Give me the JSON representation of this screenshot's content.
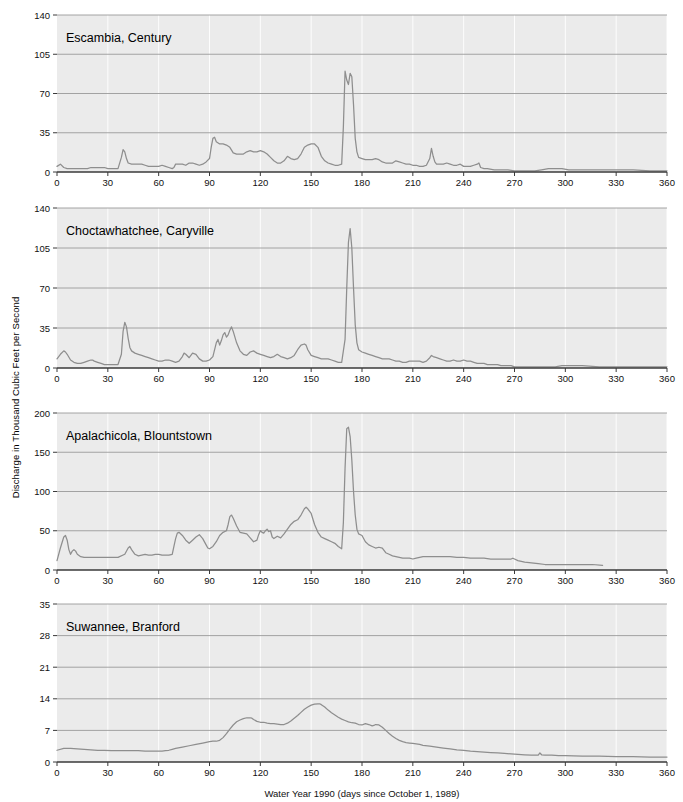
{
  "figure": {
    "width": 683,
    "height": 802,
    "background": "#ffffff",
    "plot_background": "#ebebeb",
    "line_color": "#8e8e8e",
    "hgrid_color": "#9a9a9a",
    "vgrid_color": "#ffffff",
    "axis_color": "#3a3a3a",
    "ylabel": "Discharge in Thousand Cubic Feet per Second",
    "xlabel": "Water Year 1990 (days since October 1, 1989)"
  },
  "chart_data": [
    {
      "type": "line",
      "title": "Escambia, Century",
      "xlabel": "Water Year 1990 (days since October 1, 1989)",
      "ylabel": "Discharge in Thousand Cubic Feet per Second",
      "xlim": [
        0,
        360
      ],
      "ylim": [
        0,
        140
      ],
      "xticks": [
        0,
        30,
        60,
        90,
        120,
        150,
        180,
        210,
        240,
        270,
        300,
        330,
        360
      ],
      "yticks": [
        0,
        35,
        70,
        105,
        140
      ],
      "grid": true,
      "legend": "none",
      "x": [
        0,
        2,
        4,
        6,
        8,
        10,
        12,
        14,
        16,
        18,
        20,
        22,
        24,
        26,
        28,
        30,
        32,
        34,
        36,
        38,
        39,
        40,
        41,
        42,
        44,
        46,
        48,
        50,
        52,
        54,
        56,
        58,
        60,
        62,
        64,
        66,
        68,
        69,
        70,
        72,
        74,
        76,
        78,
        80,
        82,
        84,
        86,
        88,
        90,
        91,
        92,
        93,
        94,
        96,
        98,
        100,
        102,
        104,
        106,
        108,
        110,
        112,
        114,
        116,
        118,
        120,
        122,
        124,
        126,
        128,
        130,
        132,
        134,
        136,
        138,
        140,
        142,
        144,
        146,
        148,
        150,
        152,
        154,
        156,
        158,
        160,
        162,
        164,
        166,
        168,
        169,
        170,
        171,
        172,
        173,
        174,
        175,
        176,
        177,
        178,
        180,
        182,
        184,
        186,
        188,
        190,
        192,
        194,
        196,
        198,
        200,
        202,
        204,
        206,
        208,
        210,
        212,
        214,
        216,
        218,
        220,
        221,
        222,
        223,
        224,
        226,
        228,
        230,
        232,
        234,
        236,
        238,
        240,
        242,
        244,
        246,
        248,
        249,
        250,
        252,
        254,
        258,
        262,
        266,
        270,
        274,
        278,
        282,
        286,
        290,
        294,
        298,
        302,
        306,
        310,
        320,
        330,
        340,
        350,
        360
      ],
      "y": [
        5,
        7,
        4,
        3,
        3,
        3,
        3,
        3,
        3,
        3,
        4,
        4,
        4,
        4,
        4,
        3,
        3,
        3,
        3,
        13,
        20,
        18,
        12,
        8,
        7,
        7,
        7,
        7,
        6,
        5,
        5,
        5,
        5,
        6,
        5,
        4,
        3,
        4,
        7,
        7,
        7,
        6,
        8,
        8,
        7,
        6,
        7,
        9,
        12,
        22,
        30,
        31,
        27,
        25,
        25,
        24,
        22,
        17,
        16,
        16,
        16,
        18,
        19,
        18,
        18,
        19,
        18,
        16,
        13,
        10,
        8,
        8,
        10,
        14,
        12,
        11,
        12,
        16,
        22,
        24,
        25,
        25,
        22,
        14,
        10,
        8,
        7,
        6,
        6,
        7,
        40,
        90,
        82,
        78,
        88,
        85,
        60,
        30,
        18,
        13,
        12,
        11,
        11,
        11,
        12,
        11,
        9,
        8,
        8,
        8,
        10,
        9,
        8,
        7,
        7,
        6,
        6,
        5,
        5,
        6,
        12,
        21,
        14,
        9,
        7,
        7,
        7,
        8,
        7,
        6,
        6,
        7,
        5,
        5,
        5,
        6,
        7,
        8,
        4,
        3,
        3,
        2,
        2,
        2,
        1,
        1,
        1,
        1,
        2,
        3,
        3,
        3,
        2,
        2,
        2,
        2,
        2,
        2,
        1,
        1
      ]
    },
    {
      "type": "line",
      "title": "Choctawhatchee, Caryville",
      "xlabel": "Water Year 1990 (days since October 1, 1989)",
      "ylabel": "Discharge in Thousand Cubic Feet per Second",
      "xlim": [
        0,
        360
      ],
      "ylim": [
        0,
        140
      ],
      "xticks": [
        0,
        30,
        60,
        90,
        120,
        150,
        180,
        210,
        240,
        270,
        300,
        330,
        360
      ],
      "yticks": [
        0,
        35,
        70,
        105,
        140
      ],
      "grid": true,
      "legend": "none",
      "x": [
        0,
        2,
        4,
        5,
        6,
        8,
        10,
        12,
        14,
        16,
        18,
        20,
        21,
        22,
        24,
        26,
        28,
        30,
        32,
        34,
        36,
        38,
        39,
        40,
        41,
        42,
        43,
        44,
        46,
        48,
        50,
        52,
        54,
        56,
        58,
        60,
        62,
        64,
        66,
        68,
        70,
        72,
        74,
        75,
        76,
        78,
        80,
        82,
        84,
        86,
        88,
        90,
        92,
        94,
        95,
        96,
        97,
        98,
        99,
        100,
        101,
        102,
        103,
        104,
        106,
        108,
        110,
        112,
        114,
        116,
        118,
        120,
        122,
        124,
        126,
        128,
        130,
        132,
        134,
        136,
        138,
        140,
        142,
        144,
        146,
        147,
        148,
        150,
        152,
        154,
        156,
        158,
        160,
        162,
        164,
        166,
        168,
        170,
        171,
        172,
        173,
        174,
        175,
        176,
        177,
        178,
        180,
        182,
        184,
        186,
        188,
        190,
        192,
        194,
        196,
        198,
        200,
        202,
        204,
        206,
        208,
        210,
        212,
        214,
        216,
        218,
        220,
        221,
        222,
        224,
        226,
        228,
        230,
        232,
        234,
        236,
        238,
        240,
        242,
        244,
        246,
        248,
        250,
        252,
        254,
        256,
        258,
        260,
        262,
        264,
        266,
        268,
        270,
        274,
        278,
        282,
        286,
        290,
        294,
        298,
        300,
        304,
        310,
        320,
        330,
        340,
        350,
        360
      ],
      "y": [
        8,
        12,
        15,
        14,
        12,
        7,
        5,
        4,
        4,
        5,
        6,
        7,
        7,
        6,
        5,
        4,
        3,
        3,
        3,
        3,
        3,
        12,
        32,
        40,
        36,
        26,
        18,
        15,
        13,
        12,
        11,
        10,
        9,
        8,
        7,
        6,
        6,
        7,
        7,
        6,
        5,
        6,
        10,
        13,
        12,
        9,
        13,
        12,
        8,
        6,
        6,
        7,
        10,
        22,
        25,
        20,
        24,
        29,
        31,
        27,
        29,
        33,
        36,
        32,
        22,
        15,
        12,
        11,
        14,
        15,
        13,
        12,
        11,
        10,
        9,
        10,
        12,
        10,
        9,
        8,
        9,
        11,
        16,
        20,
        21,
        20,
        16,
        11,
        10,
        9,
        8,
        8,
        8,
        7,
        6,
        5,
        5,
        25,
        70,
        110,
        122,
        105,
        70,
        38,
        22,
        16,
        14,
        13,
        12,
        11,
        10,
        9,
        8,
        8,
        8,
        7,
        6,
        6,
        5,
        5,
        6,
        6,
        6,
        6,
        5,
        6,
        9,
        11,
        10,
        9,
        8,
        7,
        6,
        6,
        7,
        6,
        6,
        7,
        6,
        6,
        5,
        4,
        4,
        4,
        3,
        3,
        3,
        3,
        2,
        2,
        2,
        2,
        1,
        1,
        1,
        1,
        1,
        1,
        1,
        2,
        2,
        2,
        2,
        1,
        1,
        1,
        1,
        1,
        1
      ]
    },
    {
      "type": "line",
      "title": "Apalachicola, Blountstown",
      "xlabel": "Water Year 1990 (days since October 1, 1989)",
      "ylabel": "Discharge in Thousand Cubic Feet per Second",
      "xlim": [
        0,
        360
      ],
      "ylim": [
        0,
        200
      ],
      "xticks": [
        0,
        30,
        60,
        90,
        120,
        150,
        180,
        210,
        240,
        270,
        300,
        330,
        360
      ],
      "yticks": [
        0,
        50,
        100,
        150,
        200
      ],
      "grid": true,
      "legend": "none",
      "x": [
        0,
        2,
        4,
        5,
        6,
        7,
        8,
        9,
        10,
        11,
        12,
        14,
        16,
        18,
        20,
        24,
        28,
        32,
        36,
        40,
        42,
        43,
        44,
        46,
        48,
        50,
        52,
        54,
        56,
        58,
        60,
        62,
        64,
        66,
        68,
        69,
        70,
        71,
        72,
        74,
        76,
        78,
        80,
        82,
        84,
        86,
        88,
        89,
        90,
        92,
        94,
        96,
        98,
        100,
        101,
        102,
        103,
        104,
        106,
        108,
        110,
        112,
        114,
        116,
        118,
        119,
        120,
        121,
        122,
        123,
        124,
        125,
        126,
        127,
        128,
        130,
        132,
        134,
        136,
        138,
        140,
        142,
        144,
        146,
        147,
        148,
        150,
        152,
        154,
        156,
        158,
        160,
        162,
        164,
        166,
        168,
        169,
        170,
        171,
        172,
        173,
        174,
        175,
        176,
        177,
        178,
        180,
        182,
        184,
        186,
        188,
        190,
        192,
        193,
        194,
        196,
        198,
        200,
        202,
        204,
        206,
        208,
        210,
        212,
        214,
        216,
        218,
        220,
        224,
        228,
        232,
        236,
        240,
        244,
        248,
        252,
        256,
        260,
        264,
        268,
        269,
        270,
        272,
        274,
        276,
        280,
        284,
        288,
        292,
        296,
        300,
        304,
        310,
        316,
        322,
        330,
        340,
        350,
        360
      ],
      "y": [
        12,
        28,
        42,
        44,
        38,
        26,
        20,
        24,
        26,
        24,
        20,
        17,
        16,
        16,
        16,
        16,
        16,
        16,
        16,
        20,
        28,
        30,
        26,
        20,
        18,
        19,
        20,
        19,
        19,
        20,
        20,
        19,
        19,
        19,
        20,
        30,
        40,
        47,
        48,
        44,
        38,
        34,
        38,
        42,
        45,
        40,
        32,
        28,
        27,
        30,
        36,
        44,
        48,
        50,
        58,
        68,
        70,
        66,
        56,
        48,
        47,
        46,
        41,
        36,
        38,
        45,
        50,
        48,
        47,
        50,
        52,
        49,
        50,
        42,
        40,
        43,
        41,
        46,
        52,
        58,
        62,
        64,
        70,
        78,
        80,
        78,
        72,
        58,
        48,
        42,
        40,
        38,
        36,
        34,
        30,
        27,
        60,
        130,
        180,
        182,
        170,
        140,
        100,
        70,
        52,
        46,
        44,
        36,
        32,
        30,
        28,
        29,
        28,
        25,
        22,
        20,
        18,
        17,
        16,
        15,
        15,
        15,
        14,
        15,
        16,
        17,
        17,
        17,
        17,
        17,
        17,
        16,
        16,
        15,
        15,
        15,
        14,
        14,
        14,
        14,
        15,
        14,
        12,
        11,
        10,
        9,
        8,
        7,
        7,
        7,
        7,
        7,
        7,
        7,
        6
      ]
    },
    {
      "type": "line",
      "title": "Suwannee, Branford",
      "xlabel": "Water Year 1990 (days since October 1, 1989)",
      "ylabel": "Discharge in Thousand Cubic Feet per Second",
      "xlim": [
        0,
        360
      ],
      "ylim": [
        0,
        35
      ],
      "xticks": [
        0,
        30,
        60,
        90,
        120,
        150,
        180,
        210,
        240,
        270,
        300,
        330,
        360
      ],
      "yticks": [
        0,
        7,
        14,
        21,
        28,
        35
      ],
      "grid": true,
      "legend": "none",
      "x": [
        0,
        4,
        8,
        12,
        16,
        20,
        24,
        28,
        32,
        36,
        40,
        44,
        48,
        52,
        56,
        60,
        62,
        64,
        66,
        68,
        70,
        74,
        78,
        82,
        86,
        90,
        92,
        94,
        96,
        98,
        100,
        102,
        104,
        106,
        108,
        110,
        112,
        114,
        115,
        116,
        118,
        120,
        122,
        124,
        126,
        128,
        130,
        132,
        134,
        136,
        138,
        140,
        142,
        144,
        146,
        148,
        150,
        152,
        154,
        155,
        156,
        158,
        160,
        162,
        164,
        166,
        168,
        170,
        172,
        174,
        176,
        178,
        180,
        182,
        184,
        186,
        187,
        188,
        190,
        192,
        194,
        196,
        198,
        200,
        202,
        204,
        206,
        208,
        210,
        212,
        214,
        216,
        220,
        224,
        228,
        232,
        236,
        240,
        244,
        248,
        252,
        256,
        260,
        264,
        268,
        272,
        276,
        280,
        282,
        284,
        285,
        286,
        288,
        292,
        296,
        300,
        310,
        320,
        330,
        340,
        350,
        360
      ],
      "y": [
        2.6,
        3.0,
        3.0,
        2.9,
        2.8,
        2.7,
        2.6,
        2.6,
        2.5,
        2.5,
        2.5,
        2.5,
        2.5,
        2.4,
        2.4,
        2.4,
        2.4,
        2.5,
        2.6,
        2.8,
        3.0,
        3.3,
        3.6,
        3.9,
        4.2,
        4.5,
        4.6,
        4.6,
        4.8,
        5.4,
        6.3,
        7.3,
        8.2,
        8.9,
        9.3,
        9.6,
        9.8,
        9.8,
        9.7,
        9.4,
        9.0,
        8.8,
        8.8,
        8.6,
        8.5,
        8.5,
        8.4,
        8.3,
        8.3,
        8.6,
        9.1,
        9.7,
        10.3,
        11.0,
        11.7,
        12.2,
        12.6,
        12.8,
        12.9,
        12.9,
        12.7,
        12.2,
        11.5,
        10.9,
        10.4,
        9.9,
        9.5,
        9.2,
        8.9,
        8.7,
        8.6,
        8.3,
        8.2,
        8.5,
        8.3,
        8.0,
        8.1,
        8.3,
        8.2,
        7.7,
        7.0,
        6.3,
        5.7,
        5.2,
        4.8,
        4.5,
        4.3,
        4.2,
        4.1,
        4.0,
        3.9,
        3.7,
        3.5,
        3.3,
        3.1,
        2.9,
        2.7,
        2.6,
        2.4,
        2.3,
        2.2,
        2.1,
        2.0,
        1.9,
        1.8,
        1.7,
        1.6,
        1.5,
        1.5,
        1.5,
        2.0,
        1.6,
        1.5,
        1.5,
        1.4,
        1.4,
        1.3,
        1.3,
        1.2,
        1.2,
        1.1,
        1.1
      ]
    }
  ]
}
